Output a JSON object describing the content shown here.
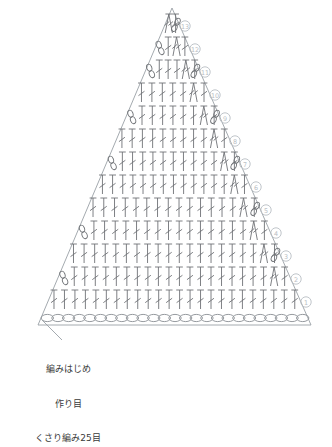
{
  "meta": {
    "width": 332,
    "height": 377
  },
  "colors": {
    "stitch": "#6f7276",
    "outline": "#9aa0a6",
    "chain": "#8a8f94",
    "row_number": "#b9bec4",
    "text": "#3a3a3a",
    "background": "#ffffff",
    "leader": "#9aa0a6"
  },
  "annotation": {
    "lines": [
      "編みはじめ",
      "作り目",
      "くさり編み25目"
    ],
    "leader_from": {
      "x": 62,
      "y": 340
    },
    "leader_to": {
      "x": 42,
      "y": 320
    }
  },
  "chart_data": {
    "type": "diagram",
    "shape": "triangle",
    "apex": {
      "x": 172,
      "y": 8
    },
    "bottom_left": {
      "x": 38,
      "y": 325
    },
    "bottom_right": {
      "x": 311,
      "y": 325
    },
    "row_count": 13,
    "foundation": {
      "label": "くさり編み25目",
      "stitch": "chain",
      "count": 25,
      "y": 318,
      "x_start": 42,
      "x_end": 308
    },
    "row_numbers": [
      {
        "n": "①",
        "value": 1,
        "x": 306,
        "y": 302
      },
      {
        "n": "②",
        "value": 2,
        "x": 296,
        "y": 279
      },
      {
        "n": "③",
        "value": 3,
        "x": 286,
        "y": 256
      },
      {
        "n": "④",
        "value": 4,
        "x": 276,
        "y": 233
      },
      {
        "n": "⑤",
        "value": 5,
        "x": 266,
        "y": 210
      },
      {
        "n": "⑥",
        "value": 6,
        "x": 256,
        "y": 187
      },
      {
        "n": "⑦",
        "value": 7,
        "x": 245,
        "y": 164
      },
      {
        "n": "⑧",
        "value": 8,
        "x": 235,
        "y": 141
      },
      {
        "n": "⑨",
        "value": 9,
        "x": 225,
        "y": 118
      },
      {
        "n": "⑩",
        "value": 10,
        "x": 215,
        "y": 95
      },
      {
        "n": "⑪",
        "value": 11,
        "x": 205,
        "y": 72
      },
      {
        "n": "⑫",
        "value": 12,
        "x": 195,
        "y": 49
      },
      {
        "n": "⑬",
        "value": 13,
        "x": 185,
        "y": 26
      }
    ],
    "rows": [
      {
        "row": 1,
        "y": 300,
        "stitch_count": 24,
        "turning_chain": false,
        "has_increase": false
      },
      {
        "row": 2,
        "y": 277,
        "stitch_count": 22,
        "turning_chain": true,
        "has_increase": true
      },
      {
        "row": 3,
        "y": 254,
        "stitch_count": 20,
        "turning_chain": false,
        "has_increase": true
      },
      {
        "row": 4,
        "y": 231,
        "stitch_count": 18,
        "turning_chain": true,
        "has_increase": true
      },
      {
        "row": 5,
        "y": 208,
        "stitch_count": 16,
        "turning_chain": false,
        "has_increase": true
      },
      {
        "row": 6,
        "y": 185,
        "stitch_count": 15,
        "turning_chain": false,
        "has_increase": true
      },
      {
        "row": 7,
        "y": 162,
        "stitch_count": 13,
        "turning_chain": true,
        "has_increase": true
      },
      {
        "row": 8,
        "y": 139,
        "stitch_count": 11,
        "turning_chain": false,
        "has_increase": true
      },
      {
        "row": 9,
        "y": 116,
        "stitch_count": 9,
        "turning_chain": true,
        "has_increase": true
      },
      {
        "row": 10,
        "y": 93,
        "stitch_count": 7,
        "turning_chain": false,
        "has_increase": true
      },
      {
        "row": 11,
        "y": 70,
        "stitch_count": 6,
        "turning_chain": true,
        "has_increase": true
      },
      {
        "row": 12,
        "y": 47,
        "stitch_count": 4,
        "turning_chain": true,
        "has_increase": true
      },
      {
        "row": 13,
        "y": 24,
        "stitch_count": 2,
        "turning_chain": false,
        "has_increase": true
      }
    ],
    "symbol_legend": [
      {
        "symbol": "double-crochet",
        "glyph": "T-with-bar",
        "description": "長編み"
      },
      {
        "symbol": "increase-pair",
        "glyph": "inverted-V",
        "description": "増し目"
      },
      {
        "symbol": "chain",
        "glyph": "oval",
        "description": "くさり編み"
      }
    ]
  }
}
